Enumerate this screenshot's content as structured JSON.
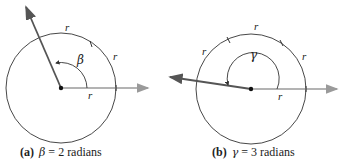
{
  "figure_a": {
    "tag": "(a)",
    "symbol": "β",
    "equation_rest": "= 2 radians",
    "arc_label": "r",
    "radius_label": "r",
    "angle_radians": 2
  },
  "figure_b": {
    "tag": "(b)",
    "symbol": "γ",
    "equation_rest": "= 3 radians",
    "arc_label": "r",
    "radius_label": "r",
    "angle_radians": 3
  },
  "colors": {
    "circle": "#333333",
    "initial_ray": "#9a9a9a",
    "terminal_ray": "#555555",
    "text": "#222222"
  }
}
